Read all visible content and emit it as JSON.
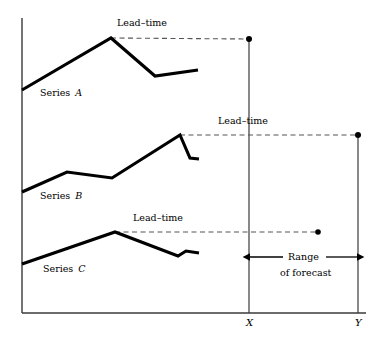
{
  "figure": {
    "labels": {
      "lead_time_a": "Lead–time",
      "lead_time_b": "Lead–time",
      "lead_time_c": "Lead–time",
      "series_a_word": "Series",
      "series_a_name": "A",
      "series_b_word": "Series",
      "series_b_name": "B",
      "series_c_word": "Series",
      "series_c_name": "C",
      "axis_x": "X",
      "axis_y": "Y",
      "range_line1": "Range",
      "range_line2": "of forecast"
    },
    "colors": {
      "ink": "#000000",
      "background": "#ffffff",
      "axis": "#3a3a3a",
      "dash": "#555555"
    }
  },
  "chart_data": {
    "type": "line",
    "title": "",
    "xlabel": "",
    "ylabel": "",
    "grid": false,
    "legend": "inline-annotations",
    "axis": {
      "origin_px": [
        22,
        313
      ],
      "y_axis_top_px": 18,
      "x_axis_right_px": 366,
      "marker_x_px": 249,
      "marker_y_px": 358
    },
    "series": [
      {
        "name": "Series A",
        "label": "A",
        "points_px": [
          [
            22,
            90
          ],
          [
            111,
            38
          ],
          [
            155,
            76
          ],
          [
            198,
            70
          ]
        ],
        "peak_px": [
          111,
          38
        ],
        "lead_time": {
          "from_px": [
            111,
            38
          ],
          "to_px": [
            249,
            39
          ],
          "endpoint_dot_px": [
            249,
            39
          ],
          "label": "Lead–time",
          "style": "dashed"
        }
      },
      {
        "name": "Series B",
        "label": "B",
        "points_px": [
          [
            22,
            192
          ],
          [
            67,
            172
          ],
          [
            112,
            178
          ],
          [
            180,
            135
          ],
          [
            190,
            158
          ],
          [
            199,
            159
          ]
        ],
        "peak_px": [
          180,
          135
        ],
        "lead_time": {
          "from_px": [
            180,
            135
          ],
          "to_px": [
            358,
            135
          ],
          "endpoint_dot_px": [
            358,
            135
          ],
          "label": "Lead–time",
          "style": "dashed"
        }
      },
      {
        "name": "Series C",
        "label": "C",
        "points_px": [
          [
            22,
            264
          ],
          [
            115,
            232
          ],
          [
            178,
            256
          ],
          [
            186,
            251
          ],
          [
            199,
            253
          ]
        ],
        "peak_px": [
          115,
          232
        ],
        "lead_time": {
          "from_px": [
            115,
            232
          ],
          "to_px": [
            318,
            232
          ],
          "endpoint_dot_px": [
            318,
            232
          ],
          "label": "Lead–time",
          "style": "dashed"
        }
      }
    ],
    "annotations": [
      {
        "name": "range-of-forecast",
        "text": [
          "Range",
          "of forecast"
        ],
        "arrow_from_px": [
          249,
          257
        ],
        "arrow_to_px": [
          358,
          257
        ],
        "double_headed": true
      },
      {
        "name": "x-marker-label",
        "text": "X",
        "at_px": [
          249,
          323
        ]
      },
      {
        "name": "y-marker-label",
        "text": "Y",
        "at_px": [
          358,
          323
        ]
      }
    ]
  }
}
